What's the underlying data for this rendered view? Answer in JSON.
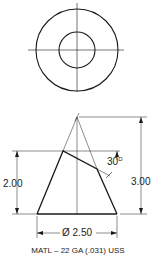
{
  "drawing": {
    "title": "Truncated cone sheet-metal development drawing",
    "top_view": {
      "description": "Top view showing outer and inner circles with centerlines"
    },
    "front_view": {
      "dimensions": {
        "total_height": "3.00",
        "cut_height": "2.00",
        "base_diameter": "Ø 2.50",
        "cut_angle": "30",
        "cut_angle_unit": "D"
      }
    },
    "material_note": "MATL – 22 GA (.031) USS"
  },
  "colors": {
    "line": "#1a1a1a",
    "background": "#ffffff"
  }
}
